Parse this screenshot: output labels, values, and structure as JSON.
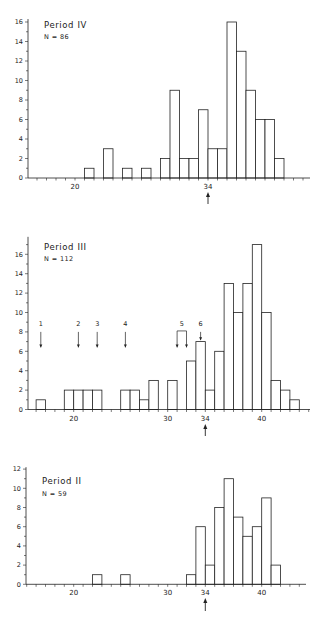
{
  "chart_data": [
    {
      "type": "bar",
      "title": "Period IV",
      "subtitle": "N = 86",
      "xlabel": "",
      "ylabel": "",
      "ylim": [
        0,
        16
      ],
      "yticks": [
        0,
        2,
        4,
        6,
        8,
        10,
        12,
        14,
        16
      ],
      "xtick_labels": [
        20,
        34
      ],
      "reference_arrow_at": 34,
      "bin_width": 1,
      "categories": [
        21,
        23,
        25,
        27,
        29,
        30,
        31,
        32,
        33,
        34,
        35,
        36,
        37,
        38,
        39,
        40,
        41
      ],
      "values": [
        1,
        3,
        1,
        1,
        2,
        9,
        2,
        2,
        7,
        3,
        3,
        16,
        13,
        9,
        6,
        6,
        2
      ],
      "grid": false
    },
    {
      "type": "bar",
      "title": "Period III",
      "subtitle": "N = 112",
      "xlabel": "",
      "ylabel": "",
      "ylim": [
        0,
        17.5
      ],
      "yticks": [
        0,
        2,
        4,
        6,
        8,
        10,
        12,
        14,
        16
      ],
      "xtick_labels": [
        20,
        30,
        34,
        40
      ],
      "reference_arrow_at": 34,
      "bin_width": 1,
      "categories": [
        16,
        19,
        20,
        21,
        22,
        25,
        26,
        27,
        28,
        30,
        32,
        33,
        34,
        35,
        36,
        37,
        38,
        39,
        40,
        41,
        42,
        43
      ],
      "values": [
        1,
        2,
        2,
        2,
        2,
        2,
        2,
        1,
        3,
        3,
        5,
        7,
        2,
        6,
        13,
        10,
        13,
        17,
        10,
        3,
        2,
        1
      ],
      "annotations": [
        {
          "label": "1",
          "x": 16.5,
          "type": "arrow"
        },
        {
          "label": "2",
          "x": 20.5,
          "type": "arrow"
        },
        {
          "label": "3",
          "x": 22.5,
          "type": "arrow"
        },
        {
          "label": "4",
          "x": 25.5,
          "type": "arrow"
        },
        {
          "label": "5",
          "x_from": 31.0,
          "x_to": 32.0,
          "type": "bracket-arrows"
        },
        {
          "label": "6",
          "x": 33.5,
          "type": "arrow-short"
        }
      ],
      "grid": false
    },
    {
      "type": "bar",
      "title": "Period II",
      "subtitle": "N = 59",
      "xlabel": "",
      "ylabel": "",
      "ylim": [
        0,
        12
      ],
      "yticks": [
        0,
        2,
        4,
        6,
        8,
        10,
        12
      ],
      "xtick_labels": [
        20,
        30,
        34,
        40
      ],
      "reference_arrow_at": 34,
      "bin_width": 1,
      "categories": [
        22,
        25,
        32,
        33,
        34,
        35,
        36,
        37,
        38,
        39,
        40,
        41
      ],
      "values": [
        1,
        1,
        1,
        6,
        2,
        8,
        11,
        7,
        5,
        6,
        9,
        2
      ],
      "grid": false
    }
  ],
  "panels": [
    {
      "title": "Period IV",
      "n_label": "N = 86",
      "layout": {
        "axisX": 28,
        "baseY": 178,
        "pxPerY": 9.75,
        "yTop": 16.3,
        "x0val": 20,
        "x0px": 75,
        "pxPerX": 9.5,
        "xMinPx": 28,
        "xMaxPx": 310,
        "xTickFrom": 15,
        "xTickTo": 44,
        "titleX": 44,
        "titleY": 28,
        "nY": 39,
        "arrowY1": 192,
        "arrowY2": 204
      }
    },
    {
      "title": "Period III",
      "n_label": "N = 112",
      "layout": {
        "axisX": 28,
        "baseY": 409.5,
        "pxPerY": 9.7,
        "yTop": 17.8,
        "x0val": 20,
        "x0px": 73.7,
        "pxPerX": 9.4,
        "xMinPx": 28,
        "xMaxPx": 310,
        "xTickFrom": 15,
        "xTickTo": 45,
        "titleX": 44,
        "titleY": 250,
        "nY": 261,
        "arrowY1": 424,
        "arrowY2": 436
      }
    },
    {
      "title": "Period II",
      "n_label": "N = 59",
      "layout": {
        "axisX": 26,
        "baseY": 584.3,
        "pxPerY": 9.6,
        "yTop": 12.2,
        "x0val": 20,
        "x0px": 73.7,
        "pxPerX": 9.4,
        "xMinPx": 26,
        "xMaxPx": 306,
        "xTickFrom": 15,
        "xTickTo": 45,
        "titleX": 42,
        "titleY": 484,
        "nY": 496,
        "arrowY1": 598,
        "arrowY2": 611
      }
    }
  ],
  "colors": {
    "ink": "#222222",
    "bar_fill": "#ffffff",
    "background": "#ffffff"
  }
}
